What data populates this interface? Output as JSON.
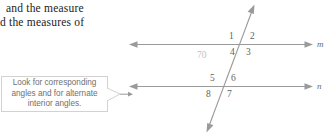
{
  "book_text": {
    "ghost_line": "elementum, angles",
    "line1": "and  the  measure",
    "line2": "d the measures of"
  },
  "callout": {
    "line1": "Look for corresponding",
    "line2": "angles and for alternate",
    "line3": "interior angles.",
    "tail_icon": "callout-pointer-arrow",
    "border_color": "#d2d2d2",
    "text_color": "#6f6f6f"
  },
  "diagram": {
    "type": "parallel-lines-transversal",
    "line_color": "#9a9a9a",
    "label_color": "#5f5f5f",
    "given_angle": "70",
    "angle_labels": [
      "1",
      "2",
      "3",
      "4",
      "5",
      "6",
      "7",
      "8"
    ],
    "line_names": [
      "m",
      "n"
    ],
    "arrow_icons": [
      "arrow-left-line-m",
      "arrow-right-line-m",
      "arrow-left-line-n",
      "arrow-right-line-n",
      "arrow-up-transversal",
      "arrow-down-transversal"
    ]
  }
}
